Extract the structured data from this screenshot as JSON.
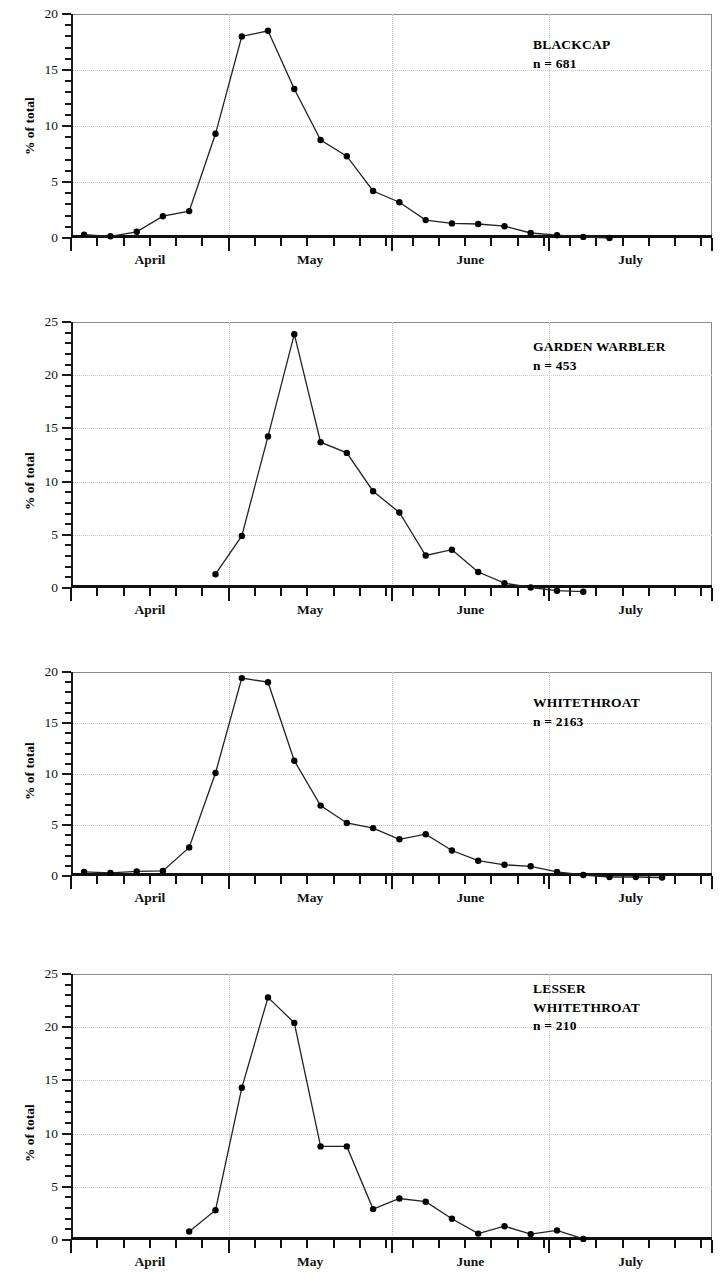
{
  "figure": {
    "faint_header": "",
    "axis_label_y": "% of total",
    "month_labels": [
      "April",
      "May",
      "June",
      "July"
    ],
    "line_color": "#222222",
    "marker_color": "#000000",
    "grid_color": "#c9c9c9"
  },
  "chart_data": [
    {
      "type": "line",
      "title": "BLACKCAP",
      "subtitle": "n = 681",
      "ylabel": "% of total",
      "xlabel": "",
      "ylim": [
        0,
        20
      ],
      "yticks": [
        0,
        5,
        10,
        15,
        20
      ],
      "ytick_labels": [
        "0",
        "5",
        "10",
        "15",
        "20"
      ],
      "grid": "dotted",
      "legend": "none",
      "xtick_labels": [
        "April",
        "May",
        "June",
        "July"
      ],
      "x": [
        5,
        10,
        15,
        20,
        25,
        30,
        35,
        40,
        45,
        50,
        55,
        60,
        65,
        70,
        75,
        80,
        85,
        90,
        95,
        100,
        105,
        110,
        115,
        120
      ],
      "values": [
        0.3,
        0.15,
        0.55,
        1.95,
        2.4,
        9.3,
        18.0,
        18.5,
        13.3,
        8.75,
        7.3,
        4.2,
        3.2,
        1.6,
        1.3,
        1.25,
        1.05,
        0.45,
        0.25,
        0.1,
        0.0,
        null,
        null,
        null
      ]
    },
    {
      "type": "line",
      "title": "GARDEN WARBLER",
      "subtitle": "n = 453",
      "ylabel": "% of total",
      "xlabel": "",
      "ylim": [
        0,
        25
      ],
      "yticks": [
        0,
        5,
        10,
        15,
        20,
        25
      ],
      "ytick_labels": [
        "0",
        "5",
        "10",
        "15",
        "20",
        "25"
      ],
      "grid": "dotted",
      "legend": "none",
      "xtick_labels": [
        "April",
        "May",
        "June",
        "July"
      ],
      "x": [
        30,
        35,
        40,
        45,
        50,
        55,
        60,
        65,
        70,
        75,
        80,
        85,
        90,
        95,
        100,
        105
      ],
      "values": [
        1.3,
        4.9,
        14.25,
        23.85,
        13.7,
        12.7,
        9.1,
        7.1,
        3.05,
        3.6,
        1.5,
        0.45,
        0.05,
        -0.25,
        -0.35,
        null
      ]
    },
    {
      "type": "line",
      "title": "WHITETHROAT",
      "subtitle": "n = 2163",
      "ylabel": "% of total",
      "xlabel": "",
      "ylim": [
        0,
        20
      ],
      "yticks": [
        0,
        5,
        10,
        15,
        20
      ],
      "ytick_labels": [
        "0",
        "5",
        "10",
        "15",
        "20"
      ],
      "grid": "dotted",
      "legend": "none",
      "xtick_labels": [
        "April",
        "May",
        "June",
        "July"
      ],
      "x": [
        5,
        10,
        15,
        20,
        25,
        30,
        35,
        40,
        45,
        50,
        55,
        60,
        65,
        70,
        75,
        80,
        85,
        90,
        95,
        100,
        105,
        110,
        115,
        120
      ],
      "values": [
        0.4,
        0.3,
        0.45,
        0.5,
        2.8,
        10.1,
        19.4,
        19.0,
        11.3,
        6.9,
        5.2,
        4.7,
        3.6,
        4.1,
        2.5,
        1.5,
        1.1,
        0.95,
        0.4,
        0.1,
        -0.1,
        -0.1,
        -0.15,
        null
      ]
    },
    {
      "type": "line",
      "title": "LESSER WHITETHROAT",
      "title_lines": [
        "LESSER",
        "WHITETHROAT"
      ],
      "subtitle": "n = 210",
      "ylabel": "% of total",
      "xlabel": "",
      "ylim": [
        0,
        25
      ],
      "yticks": [
        0,
        5,
        10,
        15,
        20,
        25
      ],
      "ytick_labels": [
        "0",
        "5",
        "10",
        "15",
        "20",
        "25"
      ],
      "grid": "dotted",
      "legend": "none",
      "xtick_labels": [
        "April",
        "May",
        "June",
        "July"
      ],
      "x": [
        25,
        30,
        35,
        40,
        45,
        50,
        55,
        60,
        65,
        70,
        75,
        80,
        85,
        90,
        95,
        100
      ],
      "values": [
        0.8,
        2.8,
        14.3,
        22.8,
        20.4,
        8.8,
        8.8,
        2.9,
        3.9,
        3.6,
        2.0,
        0.6,
        1.3,
        0.55,
        0.9,
        0.1
      ]
    }
  ]
}
